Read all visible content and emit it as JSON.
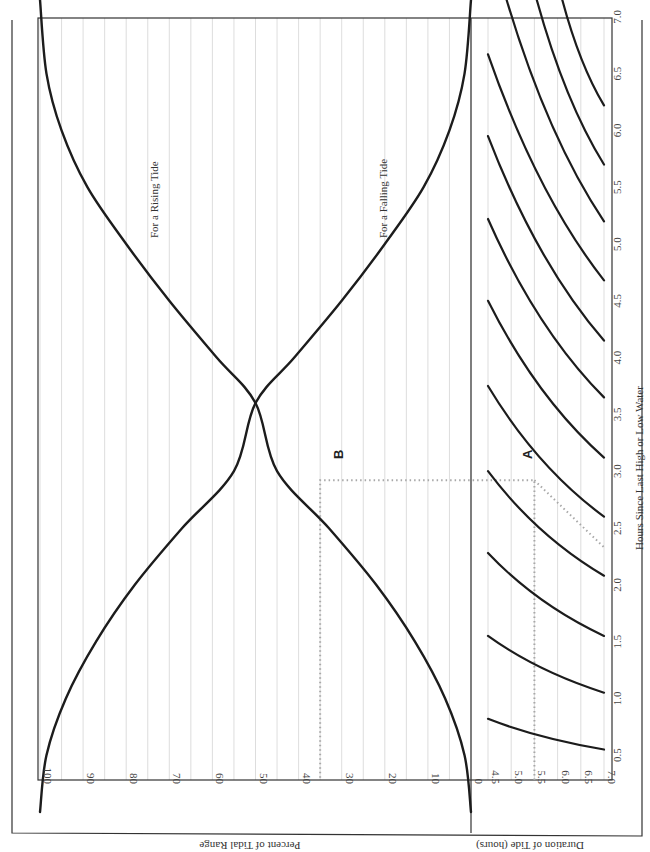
{
  "chart_data": {
    "type": "line",
    "orientation_note": "page rotated 90 degrees clockwise",
    "title": "",
    "xlabel": "Hours Since Last High or Low Water",
    "ylabel": "Percent of Tidal Range",
    "duration_label": "Duration of Tide (hours)",
    "x_ticks": [
      "0.5",
      "1.0",
      "1.5",
      "2.0",
      "2.5",
      "3.0",
      "3.5",
      "4.0",
      "4.5",
      "5.0",
      "5.5",
      "6.0",
      "6.5",
      "7.0"
    ],
    "y_ticks": [
      "100",
      "90",
      "80",
      "70",
      "60",
      "50",
      "40",
      "30",
      "20",
      "10",
      "0"
    ],
    "duration_ticks": [
      "4.5",
      "5.0",
      "5.5",
      "6.0",
      "6.5",
      "7.0"
    ],
    "xlim": [
      0,
      7.15
    ],
    "ylim": [
      0,
      100
    ],
    "duration_lim": [
      4.5,
      7.0
    ],
    "series": [
      {
        "name": "For a Rising Tide",
        "x": [
          0,
          0.5,
          1.0,
          1.5,
          2.0,
          2.5,
          3.0,
          3.6,
          4.0,
          4.5,
          5.0,
          5.5,
          6.0,
          6.5,
          7.15
        ],
        "values": [
          0,
          1.5,
          6,
          13,
          22,
          33,
          45,
          50,
          59,
          70,
          80,
          89,
          95,
          98.5,
          100
        ]
      },
      {
        "name": "For a Falling Tide",
        "x": [
          0,
          0.5,
          1.0,
          1.5,
          2.0,
          2.5,
          3.0,
          3.6,
          4.0,
          4.5,
          5.0,
          5.5,
          6.0,
          6.5,
          7.15
        ],
        "values": [
          100,
          98.5,
          94,
          87,
          78,
          67,
          55,
          50,
          41,
          30,
          20,
          11,
          5,
          1.5,
          0
        ]
      }
    ],
    "duration_lines": [
      {
        "duration_start": 7.0,
        "x_start": 0.55,
        "x_end": 0.82,
        "duration_end": 4.5
      },
      {
        "duration_start": 7.0,
        "x_start": 1.05,
        "x_end": 1.55,
        "duration_end": 4.5
      },
      {
        "duration_start": 7.0,
        "x_start": 1.55,
        "x_end": 2.28,
        "duration_end": 4.5
      },
      {
        "duration_start": 7.0,
        "x_start": 2.08,
        "x_end": 3.0,
        "duration_end": 4.5
      },
      {
        "duration_start": 7.0,
        "x_start": 2.6,
        "x_end": 3.75,
        "duration_end": 4.5
      },
      {
        "duration_start": 7.0,
        "x_start": 3.12,
        "x_end": 4.5,
        "duration_end": 4.5
      },
      {
        "duration_start": 7.0,
        "x_start": 3.65,
        "x_end": 5.22,
        "duration_end": 4.5
      },
      {
        "duration_start": 7.0,
        "x_start": 4.15,
        "x_end": 5.95,
        "duration_end": 4.5
      },
      {
        "duration_start": 7.0,
        "x_start": 4.68,
        "x_end": 6.67,
        "duration_end": 4.5
      },
      {
        "duration_start": 7.0,
        "x_start": 5.2,
        "x_end": 7.15,
        "duration_end": 4.9
      },
      {
        "duration_start": 7.0,
        "x_start": 5.7,
        "x_end": 7.15,
        "duration_end": 5.55
      },
      {
        "duration_start": 7.0,
        "x_start": 6.22,
        "x_end": 7.15,
        "duration_end": 6.1
      }
    ],
    "annotations": [
      {
        "label": "A",
        "hours": 2.92,
        "duration": 5.5,
        "guide_from_duration": 5.5,
        "guide_diagonal_to_hours": 2.33
      },
      {
        "label": "B",
        "hours": 2.92,
        "percent": 35
      }
    ],
    "curve_labels": [
      "For a Rising Tide",
      "For a Falling Tide"
    ],
    "grid": true,
    "legend": "none"
  }
}
